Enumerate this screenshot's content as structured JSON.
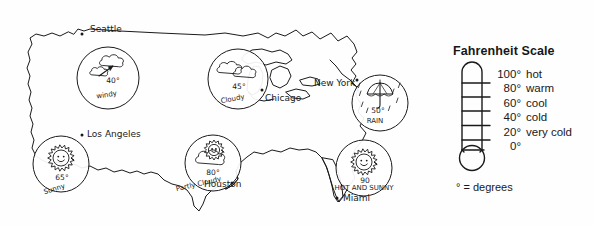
{
  "figure": {
    "kind": "weather-map-with-thermometer-legend",
    "background_color": "#fefefe",
    "ink_color": "#1a1a1a"
  },
  "map": {
    "region_label": "United States",
    "cities": [
      {
        "name": "Seattle",
        "label": "Seattle",
        "label_x": 90,
        "label_y": 32,
        "dot_x": 82,
        "dot_y": 34,
        "circle_x": 108,
        "circle_y": 78,
        "circle_r": 31,
        "icon": "cloud-windy-icon",
        "temperature": "40°",
        "condition": "windy",
        "temp_x": 113,
        "temp_y": 83,
        "cond_x": 107,
        "cond_y": 97,
        "cond_rotate": -9
      },
      {
        "name": "Chicago",
        "label": "Chicago",
        "label_x": 265,
        "label_y": 101,
        "dot_x": 262,
        "dot_y": 90,
        "circle_x": 238,
        "circle_y": 79,
        "circle_r": 30,
        "icon": "cloudy-icon",
        "temperature": "45°",
        "condition": "Cloudy",
        "temp_x": 239,
        "temp_y": 89,
        "cond_x": 233,
        "cond_y": 101,
        "cond_rotate": -11
      },
      {
        "name": "New York",
        "label": "New York",
        "label_x": 314,
        "label_y": 86,
        "dot_x": 357,
        "dot_y": 80,
        "circle_x": 380,
        "circle_y": 103,
        "circle_r": 28,
        "icon": "umbrella-rain-icon",
        "temperature": "50°",
        "condition": "RAIN",
        "temp_x": 378,
        "temp_y": 113,
        "cond_x": 375,
        "cond_y": 123,
        "cond_rotate": 0
      },
      {
        "name": "Los Angeles",
        "label": "Los Angeles",
        "label_x": 87,
        "label_y": 137,
        "dot_x": 82,
        "dot_y": 135,
        "circle_x": 61,
        "circle_y": 164,
        "circle_r": 28,
        "icon": "sun-face-icon",
        "temperature": "65°",
        "condition": "Sunny",
        "temp_x": 62,
        "temp_y": 180,
        "cond_x": 55,
        "cond_y": 191,
        "cond_rotate": -17
      },
      {
        "name": "Houston",
        "label": "Houston",
        "label_x": 204,
        "label_y": 187,
        "dot_x": 232,
        "dot_y": 183,
        "circle_x": 213,
        "circle_y": 163,
        "circle_r": 28,
        "icon": "sun-behind-cloud-icon",
        "temperature": "80°",
        "condition": "Partly Cloudy",
        "temp_x": 213,
        "temp_y": 175,
        "cond_x": 199,
        "cond_y": 186,
        "cond_rotate": -13
      },
      {
        "name": "Miami",
        "label": "Miami",
        "label_x": 343,
        "label_y": 201,
        "dot_x": 337,
        "dot_y": 198,
        "circle_x": 364,
        "circle_y": 168,
        "circle_r": 28,
        "icon": "sun-face-icon",
        "temperature": "90",
        "condition": "HOT AND SUNNY",
        "temp_x": 365,
        "temp_y": 183,
        "cond_x": 364,
        "cond_y": 190,
        "cond_rotate": 0
      }
    ]
  },
  "legend": {
    "title": "Fahrenheit Scale",
    "note": "° = degrees",
    "rows": [
      {
        "temp": "100°",
        "word": "hot"
      },
      {
        "temp": "80°",
        "word": "warm"
      },
      {
        "temp": "60°",
        "word": "cool"
      },
      {
        "temp": "40°",
        "word": "cold"
      },
      {
        "temp": "20°",
        "word": "very cold"
      },
      {
        "temp": "0°",
        "word": ""
      }
    ],
    "thermometer": {
      "tick_count": 6,
      "has_bulb": true,
      "outline_color": "#1a1a1a"
    }
  }
}
